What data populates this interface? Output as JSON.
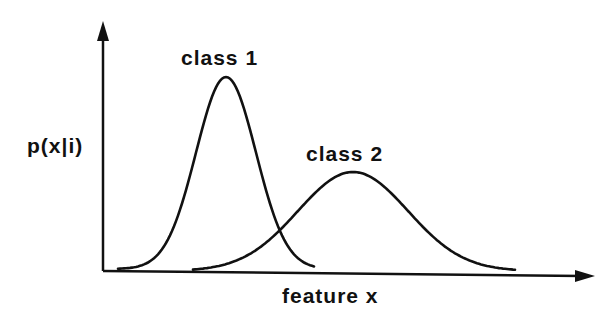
{
  "diagram": {
    "type": "class-conditional-density",
    "y_axis_label": "p(x|i)",
    "x_axis_label": "feature x",
    "colors": {
      "stroke": "#111111",
      "background": "#ffffff"
    }
  },
  "classes": [
    {
      "label": "class 1",
      "peak_height": "tall",
      "spread": "narrow",
      "position": "left"
    },
    {
      "label": "class 2",
      "peak_height": "short",
      "spread": "wide",
      "position": "right"
    }
  ],
  "geometry": {
    "origin": [
      103,
      271
    ],
    "y_axis_tip": [
      103,
      22
    ],
    "x_axis_tip": [
      594,
      276
    ],
    "class1": {
      "mean_x": 226,
      "peak_y": 77,
      "sigma": 30,
      "x_start": 118,
      "x_end": 314,
      "base_y": 269
    },
    "class2": {
      "mean_x": 353,
      "peak_y": 172,
      "sigma": 55,
      "x_start": 193,
      "x_end": 516,
      "base_y": 271
    }
  }
}
